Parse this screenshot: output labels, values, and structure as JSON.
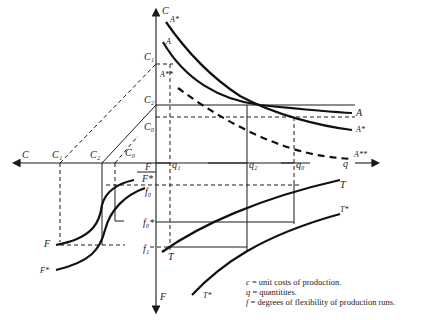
{
  "diagram": {
    "axes": {
      "vertical_up": "C",
      "vertical_down": "F",
      "horizontal_left": "C",
      "horizontal_right": "q"
    },
    "cost_labels_vertical": [
      "C₁",
      "C₂",
      "C₀"
    ],
    "cost_labels_horizontal": [
      "C₁",
      "C₂",
      "C₀"
    ],
    "quantity_labels": [
      "q₁",
      "q₂",
      "q₀"
    ],
    "flex_labels": [
      "F",
      "F*",
      "f₀",
      "f₀*",
      "f₁"
    ],
    "curves": {
      "A": "A",
      "A_star": "A*",
      "A_2star": "A**",
      "T": "T",
      "T_star": "T*",
      "F": "F",
      "F_star": "F*"
    },
    "legend": [
      {
        "symbol": "c",
        "text": " = unit costs of production."
      },
      {
        "symbol": "q",
        "text": " = quantitites."
      },
      {
        "symbol": "f",
        "text": " = degrees of flexibility of production runs."
      }
    ]
  }
}
